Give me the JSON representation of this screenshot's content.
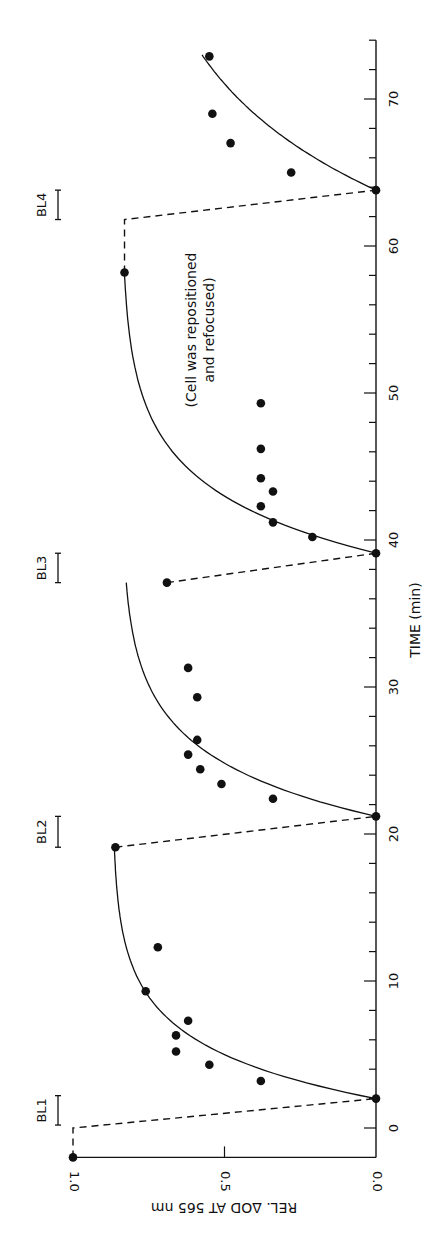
{
  "chart_data": {
    "type": "scatter",
    "orientation": "rotated-90",
    "title": "",
    "xlabel": "TIME (min)",
    "ylabel": "REL. ΔOD AT 565 nm",
    "xlim": [
      -2,
      74
    ],
    "ylim": [
      0.0,
      1.0
    ],
    "x_ticks_major": [
      0,
      10,
      20,
      30,
      40,
      50,
      60,
      70
    ],
    "x_ticks_minor_step": 2,
    "y_ticks": [
      0.0,
      0.5,
      1.0
    ],
    "y_tick_labels": [
      "0.0",
      "0.5",
      "1.0"
    ],
    "grid": false,
    "legend": null,
    "annotation": {
      "lines": [
        "(Cell was repositioned",
        "and refocused)"
      ],
      "t": 50,
      "od": 0.6
    },
    "bleach_periods": [
      {
        "label": "BL1",
        "t_start": 0.2,
        "t_end": 2.2
      },
      {
        "label": "BL2",
        "t_start": 19.1,
        "t_end": 21.2
      },
      {
        "label": "BL3",
        "t_start": 37.1,
        "t_end": 39.1
      },
      {
        "label": "BL4",
        "t_start": 61.8,
        "t_end": 63.8
      }
    ],
    "series": [
      {
        "name": "measured",
        "points": [
          {
            "t": -2.0,
            "od": 1.0
          },
          {
            "t": 2.0,
            "od": 0.0
          },
          {
            "t": 3.2,
            "od": 0.38
          },
          {
            "t": 4.3,
            "od": 0.55
          },
          {
            "t": 5.2,
            "od": 0.66
          },
          {
            "t": 6.3,
            "od": 0.66
          },
          {
            "t": 7.3,
            "od": 0.62
          },
          {
            "t": 9.3,
            "od": 0.76
          },
          {
            "t": 12.3,
            "od": 0.72
          },
          {
            "t": 19.1,
            "od": 0.86
          },
          {
            "t": 21.2,
            "od": 0.0
          },
          {
            "t": 22.4,
            "od": 0.34
          },
          {
            "t": 23.4,
            "od": 0.51
          },
          {
            "t": 24.4,
            "od": 0.58
          },
          {
            "t": 25.4,
            "od": 0.62
          },
          {
            "t": 26.4,
            "od": 0.59
          },
          {
            "t": 29.3,
            "od": 0.59
          },
          {
            "t": 31.3,
            "od": 0.62
          },
          {
            "t": 37.1,
            "od": 0.69
          },
          {
            "t": 39.1,
            "od": 0.0
          },
          {
            "t": 40.2,
            "od": 0.21
          },
          {
            "t": 41.2,
            "od": 0.34
          },
          {
            "t": 42.3,
            "od": 0.38
          },
          {
            "t": 43.3,
            "od": 0.34
          },
          {
            "t": 44.2,
            "od": 0.38
          },
          {
            "t": 46.2,
            "od": 0.38
          },
          {
            "t": 49.3,
            "od": 0.38
          },
          {
            "t": 58.2,
            "od": 0.83
          },
          {
            "t": 63.8,
            "od": 0.0
          },
          {
            "t": 65.0,
            "od": 0.28
          },
          {
            "t": 67.0,
            "od": 0.48
          },
          {
            "t": 69.0,
            "od": 0.54
          },
          {
            "t": 72.9,
            "od": 0.55
          }
        ]
      }
    ],
    "fit_curves": [
      {
        "name": "recovery-1",
        "t0": 2.0,
        "t_end": 19.1,
        "od_max": 0.87,
        "tau": 3.5
      },
      {
        "name": "recovery-2",
        "t0": 21.2,
        "t_end": 37.1,
        "od_max": 0.84,
        "tau": 4.0
      },
      {
        "name": "recovery-3",
        "t0": 39.1,
        "t_end": 58.2,
        "od_max": 0.84,
        "tau": 4.3
      },
      {
        "name": "recovery-4",
        "t0": 63.8,
        "t_end": 73.0,
        "od_max": 0.84,
        "tau": 8.0
      }
    ],
    "dashed_links": [
      [
        {
          "t": -2.0,
          "od": 1.0
        },
        {
          "t": 0.0,
          "od": 1.0
        },
        {
          "t": 2.0,
          "od": 0.0
        }
      ],
      [
        {
          "t": 19.1,
          "od": 0.86
        },
        {
          "t": 21.2,
          "od": 0.0
        }
      ],
      [
        {
          "t": 37.1,
          "od": 0.69
        },
        {
          "t": 39.1,
          "od": 0.0
        }
      ],
      [
        {
          "t": 58.2,
          "od": 0.83
        },
        {
          "t": 61.8,
          "od": 0.83
        },
        {
          "t": 63.8,
          "od": 0.0
        }
      ]
    ]
  }
}
